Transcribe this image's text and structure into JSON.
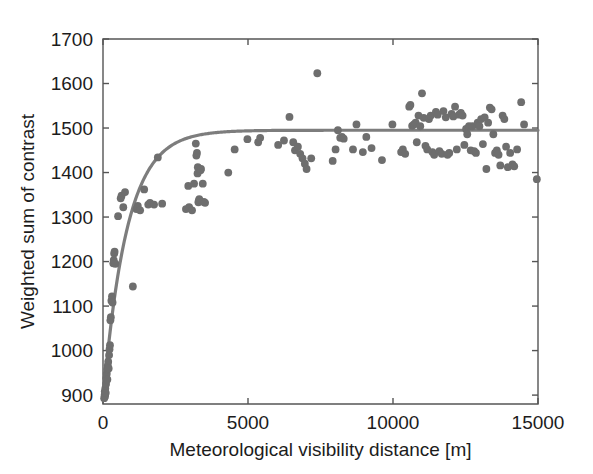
{
  "chart_data": {
    "type": "scatter",
    "title": "",
    "xlabel": "Meteorological visibility distance [m]",
    "ylabel": "Weighted sum of contrast",
    "xlim": [
      0,
      15000
    ],
    "ylim": [
      880,
      1700
    ],
    "grid": false,
    "legend": null,
    "xticks": [
      0,
      5000,
      10000,
      15000
    ],
    "xtick_labels": [
      "0",
      "5000",
      "10000",
      "15000"
    ],
    "yticks": [
      900,
      1000,
      1100,
      1200,
      1300,
      1400,
      1500,
      1600,
      1700
    ],
    "ytick_labels": [
      "900",
      "1000",
      "1100",
      "1200",
      "1300",
      "1400",
      "1500",
      "1600",
      "1700"
    ],
    "marker_color": "#6e6e6e",
    "marker_size": 5,
    "series": [
      {
        "name": "measurements",
        "type": "scatter",
        "color": "#6e6e6e",
        "points": [
          [
            40,
            893
          ],
          [
            55,
            900
          ],
          [
            60,
            908
          ],
          [
            70,
            897
          ],
          [
            80,
            915
          ],
          [
            95,
            905
          ],
          [
            105,
            925
          ],
          [
            115,
            938
          ],
          [
            130,
            948
          ],
          [
            145,
            958
          ],
          [
            150,
            935
          ],
          [
            165,
            966
          ],
          [
            180,
            975
          ],
          [
            195,
            960
          ],
          [
            210,
            990
          ],
          [
            225,
            1003
          ],
          [
            240,
            1012
          ],
          [
            255,
            1068
          ],
          [
            270,
            1075
          ],
          [
            290,
            1112
          ],
          [
            310,
            1122
          ],
          [
            330,
            1108
          ],
          [
            355,
            1196
          ],
          [
            370,
            1203
          ],
          [
            385,
            1218
          ],
          [
            400,
            1222
          ],
          [
            430,
            1195
          ],
          [
            520,
            1302
          ],
          [
            610,
            1342
          ],
          [
            640,
            1348
          ],
          [
            700,
            1322
          ],
          [
            760,
            1356
          ],
          [
            1030,
            1144
          ],
          [
            1150,
            1318
          ],
          [
            1200,
            1325
          ],
          [
            1280,
            1315
          ],
          [
            1420,
            1362
          ],
          [
            1560,
            1328
          ],
          [
            1620,
            1332
          ],
          [
            1760,
            1328
          ],
          [
            1890,
            1434
          ],
          [
            2040,
            1330
          ],
          [
            2860,
            1318
          ],
          [
            2940,
            1370
          ],
          [
            2970,
            1322
          ],
          [
            3070,
            1315
          ],
          [
            3140,
            1375
          ],
          [
            3200,
            1465
          ],
          [
            3220,
            1438
          ],
          [
            3240,
            1444
          ],
          [
            3260,
            1398
          ],
          [
            3270,
            1412
          ],
          [
            3290,
            1333
          ],
          [
            3300,
            1336
          ],
          [
            3320,
            1340
          ],
          [
            3360,
            1405
          ],
          [
            3380,
            1408
          ],
          [
            3440,
            1375
          ],
          [
            3480,
            1334
          ],
          [
            3520,
            1332
          ],
          [
            4320,
            1400
          ],
          [
            4540,
            1452
          ],
          [
            4980,
            1475
          ],
          [
            5350,
            1468
          ],
          [
            5420,
            1478
          ],
          [
            6040,
            1462
          ],
          [
            6240,
            1472
          ],
          [
            6430,
            1525
          ],
          [
            6560,
            1468
          ],
          [
            6620,
            1450
          ],
          [
            6720,
            1458
          ],
          [
            6800,
            1442
          ],
          [
            6880,
            1432
          ],
          [
            6960,
            1420
          ],
          [
            7020,
            1408
          ],
          [
            7180,
            1432
          ],
          [
            7390,
            1623
          ],
          [
            7920,
            1426
          ],
          [
            8020,
            1452
          ],
          [
            8100,
            1495
          ],
          [
            8180,
            1478
          ],
          [
            8240,
            1480
          ],
          [
            8300,
            1476
          ],
          [
            8620,
            1452
          ],
          [
            8740,
            1508
          ],
          [
            8960,
            1446
          ],
          [
            9080,
            1480
          ],
          [
            9260,
            1455
          ],
          [
            9620,
            1428
          ],
          [
            9980,
            1508
          ],
          [
            10280,
            1446
          ],
          [
            10340,
            1452
          ],
          [
            10420,
            1442
          ],
          [
            10560,
            1548
          ],
          [
            10600,
            1552
          ],
          [
            10660,
            1505
          ],
          [
            10720,
            1508
          ],
          [
            10780,
            1512
          ],
          [
            10820,
            1468
          ],
          [
            10880,
            1528
          ],
          [
            10940,
            1504
          ],
          [
            11000,
            1578
          ],
          [
            11060,
            1523
          ],
          [
            11120,
            1460
          ],
          [
            11180,
            1452
          ],
          [
            11240,
            1520
          ],
          [
            11300,
            1528
          ],
          [
            11360,
            1446
          ],
          [
            11420,
            1440
          ],
          [
            11480,
            1536
          ],
          [
            11540,
            1530
          ],
          [
            11600,
            1448
          ],
          [
            11680,
            1442
          ],
          [
            11740,
            1538
          ],
          [
            11820,
            1524
          ],
          [
            11880,
            1440
          ],
          [
            11940,
            1444
          ],
          [
            12020,
            1532
          ],
          [
            12080,
            1526
          ],
          [
            12140,
            1548
          ],
          [
            12200,
            1452
          ],
          [
            12280,
            1530
          ],
          [
            12340,
            1534
          ],
          [
            12400,
            1528
          ],
          [
            12460,
            1462
          ],
          [
            12520,
            1498
          ],
          [
            12560,
            1486
          ],
          [
            12620,
            1504
          ],
          [
            12680,
            1450
          ],
          [
            12740,
            1504
          ],
          [
            12800,
            1448
          ],
          [
            12860,
            1444
          ],
          [
            12920,
            1512
          ],
          [
            12980,
            1504
          ],
          [
            13040,
            1520
          ],
          [
            13100,
            1464
          ],
          [
            13160,
            1524
          ],
          [
            13220,
            1408
          ],
          [
            13280,
            1512
          ],
          [
            13340,
            1546
          ],
          [
            13400,
            1542
          ],
          [
            13460,
            1486
          ],
          [
            13520,
            1444
          ],
          [
            13580,
            1450
          ],
          [
            13640,
            1440
          ],
          [
            13700,
            1416
          ],
          [
            13780,
            1528
          ],
          [
            13840,
            1520
          ],
          [
            13900,
            1458
          ],
          [
            13960,
            1412
          ],
          [
            14040,
            1444
          ],
          [
            14120,
            1418
          ],
          [
            14180,
            1414
          ],
          [
            14280,
            1452
          ],
          [
            14420,
            1558
          ],
          [
            14520,
            1508
          ],
          [
            14960,
            1385
          ]
        ]
      },
      {
        "name": "fitted-curve",
        "type": "line",
        "color": "#7d7d7d",
        "model": "saturating-exponential",
        "equation": "y = 1495 - 610 * exp(-x / 820)",
        "asymptote": 1495,
        "amplitude": 610,
        "scale": 820,
        "x_start": 20,
        "x_end": 15000
      }
    ]
  },
  "axes": {
    "x_axis_name": "x-axis",
    "y_axis_name": "y-axis"
  }
}
